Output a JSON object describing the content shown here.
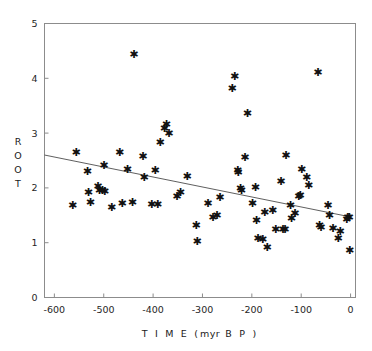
{
  "chart_data": {
    "type": "scatter",
    "title": "",
    "xlabel": "T I M E ( myr B P )",
    "xlabel_spaced": "T I M E (",
    "xlabel_unit": "myr",
    "xlabel_tail": "B P )",
    "ylabel": "ROOT",
    "ylabel_chars": [
      "R",
      "O",
      "O",
      "T"
    ],
    "xlim": [
      -620,
      10
    ],
    "ylim": [
      0,
      5
    ],
    "xticks": [
      -600,
      -500,
      -400,
      -300,
      -200,
      -100,
      0
    ],
    "xticklabels": [
      "-600",
      "-500",
      "-400",
      "-300",
      "-200",
      "-100",
      "0"
    ],
    "yticks": [
      0,
      1,
      2,
      3,
      4,
      5
    ],
    "yticklabels": [
      "0",
      "1",
      "2",
      "3",
      "4",
      "5"
    ],
    "grid": false,
    "legend": null,
    "marker": "asterisk-star",
    "marker_color": "#111111",
    "frame_color": "#8c8c8c",
    "line_color": "#4d4d4d",
    "trendline": {
      "name": "linear regression",
      "x": [
        -620,
        0
      ],
      "y": [
        2.6,
        1.47
      ]
    },
    "points": [
      {
        "x": -563,
        "y": 1.68
      },
      {
        "x": -556,
        "y": 2.66
      },
      {
        "x": -533,
        "y": 2.31
      },
      {
        "x": -531,
        "y": 1.92
      },
      {
        "x": -527,
        "y": 1.74
      },
      {
        "x": -512,
        "y": 2.03
      },
      {
        "x": -509,
        "y": 1.97
      },
      {
        "x": -503,
        "y": 1.96
      },
      {
        "x": -500,
        "y": 2.42
      },
      {
        "x": -498,
        "y": 1.95
      },
      {
        "x": -484,
        "y": 1.65
      },
      {
        "x": -468,
        "y": 2.66
      },
      {
        "x": -463,
        "y": 1.72
      },
      {
        "x": -452,
        "y": 2.34
      },
      {
        "x": -442,
        "y": 1.74
      },
      {
        "x": -439,
        "y": 4.45
      },
      {
        "x": -421,
        "y": 2.59
      },
      {
        "x": -418,
        "y": 2.19
      },
      {
        "x": -403,
        "y": 1.71
      },
      {
        "x": -396,
        "y": 2.33
      },
      {
        "x": -391,
        "y": 1.71
      },
      {
        "x": -386,
        "y": 2.84
      },
      {
        "x": -377,
        "y": 3.09
      },
      {
        "x": -373,
        "y": 3.17
      },
      {
        "x": -368,
        "y": 3.0
      },
      {
        "x": -352,
        "y": 1.86
      },
      {
        "x": -345,
        "y": 1.92
      },
      {
        "x": -331,
        "y": 2.21
      },
      {
        "x": -313,
        "y": 1.33
      },
      {
        "x": -311,
        "y": 1.03
      },
      {
        "x": -289,
        "y": 1.72
      },
      {
        "x": -279,
        "y": 1.46
      },
      {
        "x": -271,
        "y": 1.51
      },
      {
        "x": -265,
        "y": 1.83
      },
      {
        "x": -240,
        "y": 3.83
      },
      {
        "x": -235,
        "y": 4.04
      },
      {
        "x": -229,
        "y": 2.33
      },
      {
        "x": -228,
        "y": 2.29
      },
      {
        "x": -223,
        "y": 1.99
      },
      {
        "x": -221,
        "y": 1.96
      },
      {
        "x": -214,
        "y": 2.56
      },
      {
        "x": -209,
        "y": 3.36
      },
      {
        "x": -199,
        "y": 1.72
      },
      {
        "x": -193,
        "y": 2.01
      },
      {
        "x": -191,
        "y": 1.42
      },
      {
        "x": -188,
        "y": 1.09
      },
      {
        "x": -178,
        "y": 1.07
      },
      {
        "x": -174,
        "y": 1.56
      },
      {
        "x": -169,
        "y": 0.92
      },
      {
        "x": -158,
        "y": 1.59
      },
      {
        "x": -152,
        "y": 1.25
      },
      {
        "x": -141,
        "y": 2.13
      },
      {
        "x": -137,
        "y": 1.25
      },
      {
        "x": -133,
        "y": 1.25
      },
      {
        "x": -131,
        "y": 2.6
      },
      {
        "x": -122,
        "y": 1.68
      },
      {
        "x": -120,
        "y": 1.45
      },
      {
        "x": -113,
        "y": 1.55
      },
      {
        "x": -105,
        "y": 1.85
      },
      {
        "x": -102,
        "y": 1.87
      },
      {
        "x": -99,
        "y": 2.35
      },
      {
        "x": -89,
        "y": 2.2
      },
      {
        "x": -85,
        "y": 2.06
      },
      {
        "x": -66,
        "y": 4.11
      },
      {
        "x": -63,
        "y": 1.33
      },
      {
        "x": -60,
        "y": 1.28
      },
      {
        "x": -46,
        "y": 1.69
      },
      {
        "x": -43,
        "y": 1.51
      },
      {
        "x": -36,
        "y": 1.26
      },
      {
        "x": -25,
        "y": 1.08
      },
      {
        "x": -21,
        "y": 1.22
      },
      {
        "x": -8,
        "y": 1.44
      },
      {
        "x": -6,
        "y": 1.47
      },
      {
        "x": -3,
        "y": 1.46
      },
      {
        "x": -2,
        "y": 0.86
      }
    ]
  }
}
